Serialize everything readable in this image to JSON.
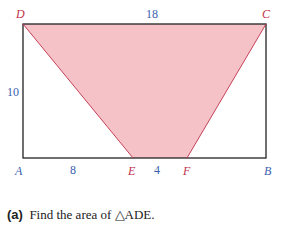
{
  "figure": {
    "vertices": {
      "A": {
        "label": "A",
        "color": "#3a5fb0"
      },
      "B": {
        "label": "B",
        "color": "#3a5fb0"
      },
      "C": {
        "label": "C",
        "color": "#c0304a"
      },
      "D": {
        "label": "D",
        "color": "#c0304a"
      },
      "E": {
        "label": "E",
        "color": "#c0304a"
      },
      "F": {
        "label": "F",
        "color": "#c0304a"
      }
    },
    "lengths": {
      "DC": "18",
      "AD": "10",
      "AE": "8",
      "EF": "4"
    },
    "shaded_region": "DCFE",
    "shade_color": "#f5c2c8",
    "line_color": "#222222"
  },
  "question": {
    "marker": "(a)",
    "text": "Find the area of △ADE."
  }
}
